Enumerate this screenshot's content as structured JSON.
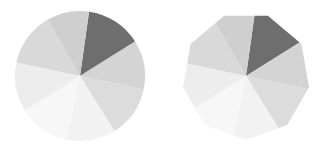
{
  "canvas": {
    "width": 325,
    "height": 150,
    "background": "#ffffff"
  },
  "figures": [
    {
      "name": "circular-pie",
      "shape": "circle",
      "center_x": 80,
      "center_y": 76,
      "radius": 65
    },
    {
      "name": "polygonal-pie",
      "shape": "polygon",
      "center_x": 246,
      "center_y": 76,
      "radius": 64,
      "sides": 9
    }
  ],
  "chart_data": {
    "type": "pie",
    "title": "",
    "subtitle": "",
    "xlabel": "",
    "ylabel": "",
    "legend_position": "none",
    "grid": false,
    "labels": [
      "wedge-1",
      "wedge-2",
      "wedge-3",
      "wedge-4",
      "wedge-5",
      "wedge-6",
      "wedge-7",
      "wedge-8"
    ],
    "values": [
      14,
      12,
      13,
      12,
      13,
      12,
      12,
      12
    ],
    "start_angle": -82,
    "colors": [
      "#6e6e6e",
      "#d4d4d4",
      "#dcdcdc",
      "#f2f2f2",
      "#f7f7f7",
      "#ededed",
      "#d9d9d9",
      "#cfcfcf"
    ],
    "wedge_angles_deg": [
      {
        "label": "wedge-1",
        "start": -82,
        "end": -32,
        "color": "#6e6e6e"
      },
      {
        "label": "wedge-2",
        "start": -32,
        "end": 12,
        "color": "#d4d4d4"
      },
      {
        "label": "wedge-3",
        "start": 12,
        "end": 58,
        "color": "#dcdcdc"
      },
      {
        "label": "wedge-4",
        "start": 58,
        "end": 102,
        "color": "#f2f2f2"
      },
      {
        "label": "wedge-5",
        "start": 102,
        "end": 148,
        "color": "#f7f7f7"
      },
      {
        "label": "wedge-6",
        "start": 148,
        "end": 192,
        "color": "#ededed"
      },
      {
        "label": "wedge-7",
        "start": 192,
        "end": 240,
        "color": "#d9d9d9"
      },
      {
        "label": "wedge-8",
        "start": 240,
        "end": 278,
        "color": "#cfcfcf"
      }
    ]
  },
  "colors": {
    "background": "#ffffff",
    "darkest_wedge": "#6e6e6e",
    "lightest_wedge": "#f7f7f7"
  }
}
